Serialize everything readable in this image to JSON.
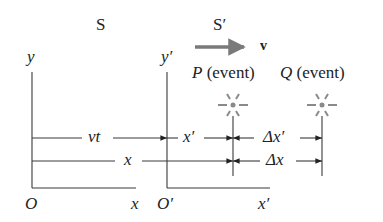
{
  "frames": {
    "s": {
      "label": "S",
      "y_axis": "y",
      "origin": "O",
      "x_axis": "x"
    },
    "s_prime": {
      "label": "S′",
      "y_axis": "y′",
      "origin": "O′",
      "x_axis": "x′"
    }
  },
  "velocity": {
    "label": "v"
  },
  "events": [
    {
      "name": "P",
      "suffix": "(event)"
    },
    {
      "name": "Q",
      "suffix": "(event)"
    }
  ],
  "distances": {
    "vt": "vt",
    "x_prime": "x′",
    "delta_x_prime": "Δx′",
    "x": "x",
    "delta_x": "Δx"
  },
  "colors": {
    "line": "#3a3a3a",
    "arrow_v": "#7a7a7a",
    "event": "#8a8a8a",
    "text": "#222222"
  }
}
